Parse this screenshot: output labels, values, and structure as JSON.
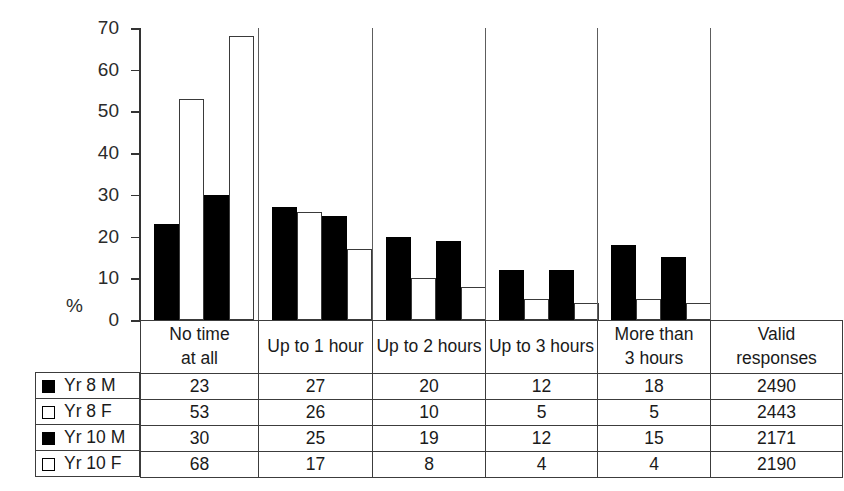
{
  "chart_data": {
    "type": "bar",
    "title": "",
    "xlabel": "",
    "ylabel": "%",
    "ylim": [
      0,
      70
    ],
    "yticks": [
      0,
      10,
      20,
      30,
      40,
      50,
      60,
      70
    ],
    "grid": false,
    "legend_position": "table-left",
    "categories": [
      "No time at all",
      "Up to 1 hour",
      "Up to 2 hours",
      "Up to 3 hours",
      "More than 3 hours"
    ],
    "series": [
      {
        "name": "Yr 8 M",
        "fill": "filled",
        "values": [
          23,
          27,
          20,
          12,
          18
        ],
        "valid_responses": 2490
      },
      {
        "name": "Yr 8 F",
        "fill": "open",
        "values": [
          53,
          26,
          10,
          5,
          5
        ],
        "valid_responses": 2443
      },
      {
        "name": "Yr 10 M",
        "fill": "filled",
        "values": [
          30,
          25,
          19,
          12,
          15
        ],
        "valid_responses": 2171
      },
      {
        "name": "Yr 10 F",
        "fill": "open",
        "values": [
          68,
          17,
          8,
          4,
          4
        ],
        "valid_responses": 2190
      }
    ]
  },
  "axis": {
    "unit_label": "%",
    "tick_labels": [
      "70",
      "60",
      "50",
      "40",
      "30",
      "20",
      "10",
      "0"
    ]
  },
  "table": {
    "headers": [
      {
        "line1": "No time",
        "line2": "at all"
      },
      {
        "line1": "Up to 1 hour",
        "line2": ""
      },
      {
        "line1": "Up to 2 hours",
        "line2": ""
      },
      {
        "line1": "Up to 3 hours",
        "line2": ""
      },
      {
        "line1": "More than",
        "line2": "3 hours"
      },
      {
        "line1": "Valid",
        "line2": "responses"
      }
    ],
    "rows": [
      {
        "label": "Yr 8 M",
        "swatch": "filled",
        "cells": [
          "23",
          "27",
          "20",
          "12",
          "18",
          "2490"
        ]
      },
      {
        "label": "Yr 8 F",
        "swatch": "open",
        "cells": [
          "53",
          "26",
          "10",
          "5",
          "5",
          "2443"
        ]
      },
      {
        "label": "Yr 10 M",
        "swatch": "filled",
        "cells": [
          "30",
          "25",
          "19",
          "12",
          "15",
          "2171"
        ]
      },
      {
        "label": "Yr 10 F",
        "swatch": "open",
        "cells": [
          "68",
          "17",
          "8",
          "4",
          "4",
          "2190"
        ]
      }
    ]
  },
  "colors": {
    "filled": "#000000",
    "open": "#ffffff",
    "outline": "#3a3a3a",
    "axis": "#333333",
    "background": "#ffffff"
  }
}
